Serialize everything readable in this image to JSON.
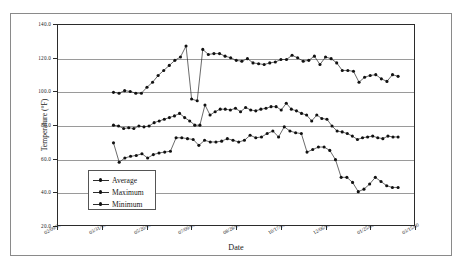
{
  "chart_data": {
    "type": "line",
    "title": "",
    "xlabel": "Date",
    "ylabel": "Temperature (°F)",
    "ylim": [
      20.0,
      140.0
    ],
    "ytick_labels": [
      "140.0",
      "120.0",
      "100.0",
      "80.0",
      "60.0",
      "40.0",
      "20.0"
    ],
    "ytick_values": [
      140.0,
      120.0,
      100.0,
      80.0,
      60.0,
      40.0,
      20.0
    ],
    "xtick_labels": [
      "02/09/99",
      "03/31/99",
      "05/20/99",
      "07/09/99",
      "08/28/99",
      "10/17/99",
      "12/06/99",
      "01/25/00",
      "03/15/00"
    ],
    "xlim_labels": [
      "02/09/99",
      "03/15/00"
    ],
    "grid": "horizontal",
    "legend_position": "lower-left-inside",
    "marker": "filled-circle",
    "line_color": "#2b2b2b",
    "marker_color": "#111111",
    "gridline_color": "#9a9a9a",
    "x_fraction_start": 0.155,
    "x_fraction_end": 0.95,
    "series": [
      {
        "name": "Average",
        "values": [
          80.5,
          80.0,
          78.5,
          79.0,
          78.5,
          80.0,
          79.5,
          80.0,
          82.0,
          83.0,
          84.0,
          85.0,
          86.0,
          87.5,
          85.0,
          83.0,
          80.5,
          80.5,
          92.5,
          86.5,
          88.5,
          90.0,
          90.0,
          89.5,
          90.5,
          88.5,
          91.0,
          89.5,
          89.0,
          90.0,
          90.5,
          91.5,
          91.5,
          89.5,
          93.5,
          90.0,
          89.0,
          87.5,
          86.5,
          83.0,
          86.5,
          84.5,
          84.0,
          80.0,
          77.0,
          76.5,
          75.5,
          74.0,
          72.0,
          73.0,
          73.5,
          74.0,
          73.0,
          72.5,
          74.0,
          73.5,
          73.5
        ]
      },
      {
        "name": "Maximum",
        "values": [
          100.0,
          99.5,
          101.0,
          100.5,
          99.5,
          99.5,
          103.0,
          106.0,
          110.0,
          113.0,
          116.0,
          119.0,
          121.0,
          127.5,
          96.0,
          95.0,
          125.5,
          122.5,
          123.0,
          123.0,
          121.5,
          120.5,
          119.0,
          118.5,
          120.0,
          117.5,
          117.0,
          116.5,
          117.5,
          118.0,
          119.5,
          119.5,
          122.0,
          120.5,
          118.5,
          119.0,
          121.5,
          116.5,
          121.0,
          120.0,
          117.5,
          113.0,
          113.0,
          112.5,
          106.0,
          109.0,
          110.0,
          110.5,
          108.0,
          106.5,
          110.5,
          109.5
        ]
      },
      {
        "name": "Minimum",
        "values": [
          70.0,
          58.5,
          61.0,
          62.0,
          62.5,
          63.5,
          61.0,
          63.0,
          64.0,
          64.5,
          65.0,
          73.0,
          73.0,
          72.5,
          72.0,
          68.5,
          71.5,
          70.5,
          70.5,
          71.0,
          72.5,
          71.5,
          70.5,
          71.5,
          74.5,
          73.0,
          73.5,
          75.5,
          77.0,
          73.5,
          79.5,
          77.0,
          76.0,
          75.5,
          64.5,
          66.0,
          67.5,
          67.5,
          65.5,
          60.0,
          49.5,
          49.5,
          46.5,
          41.0,
          42.5,
          45.5,
          49.5,
          47.0,
          44.5,
          43.5,
          43.5
        ]
      }
    ],
    "legend": [
      "Average",
      "Maximum",
      "Minimum"
    ]
  }
}
